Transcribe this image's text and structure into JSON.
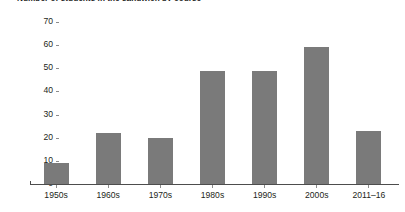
{
  "chart_data": {
    "type": "bar",
    "title": "Number of students in the sandwich by course",
    "xlabel": "",
    "ylabel": "",
    "categories": [
      "1950s",
      "1960s",
      "1970s",
      "1980s",
      "1990s",
      "2000s",
      "2011–16"
    ],
    "values": [
      9,
      22,
      20,
      49,
      49,
      59,
      23
    ],
    "series": [
      {
        "name": "Number of students",
        "values": [
          9,
          22,
          20,
          49,
          49,
          59,
          23
        ]
      }
    ],
    "ylim": [
      0,
      70
    ],
    "y_ticks": [
      0,
      10,
      20,
      30,
      40,
      50,
      60,
      70
    ],
    "y_tick_labels": [
      "0",
      "10",
      "20",
      "30",
      "40",
      "50",
      "60",
      "70"
    ],
    "grid": false,
    "legend": false,
    "legend_position": "none",
    "bar_color": "#7a7a7a",
    "axis_color": "#4d4d4d",
    "tick_color": "#8c8c8c",
    "text_color": "#231f20",
    "background_color": "#ffffff"
  }
}
